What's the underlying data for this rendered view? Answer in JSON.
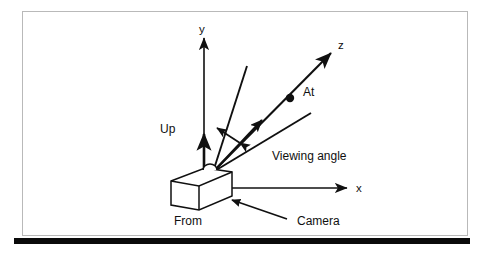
{
  "figure": {
    "kind": "technical-diagram",
    "frame_border_color": "#b9b9b9",
    "background_color": "#ffffff",
    "ink_color": "#101010",
    "rule_color": "#0a0a0a"
  },
  "labels": {
    "y_axis": "y",
    "z_axis": "z",
    "x_axis": "x",
    "up_vector": "Up",
    "at_point": "At",
    "viewing_angle": "Viewing angle",
    "from_point": "From",
    "camera": "Camera"
  },
  "geometry": {
    "origin": {
      "x": 213,
      "y": 172
    },
    "y_axis_tip": {
      "x": 204,
      "y": 31
    },
    "x_axis_tip": {
      "x": 352,
      "y": 188
    },
    "z_axis_tip": {
      "x": 336,
      "y": 48
    },
    "at_dot": {
      "x": 290,
      "y": 98
    },
    "up_arrow_tip": {
      "x": 204,
      "y": 128
    },
    "upper_ray_tip": {
      "x": 247,
      "y": 66
    },
    "lower_ray_tip": {
      "x": 311,
      "y": 113
    },
    "camera_arrow_tail": {
      "x": 287,
      "y": 219
    },
    "camera_arrow_tip": {
      "x": 228,
      "y": 199
    }
  },
  "icon_names": {
    "y_axis": "arrow-up-icon",
    "x_axis": "arrow-right-icon",
    "z_axis": "arrow-diagonal-icon",
    "up_vector": "arrow-up-icon",
    "at_point": "dot-icon",
    "view_cone": "angle-rays-icon",
    "viewing_angle_measure": "double-arrow-icon",
    "camera_body": "camera-box-icon",
    "camera_pointer": "arrow-pointer-icon",
    "lens_bump": "lens-dome-icon"
  }
}
